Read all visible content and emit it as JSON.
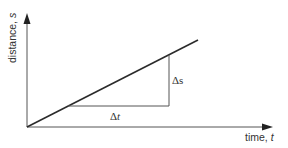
{
  "diagram": {
    "y_axis": {
      "label": "distance, ",
      "symbol": "s"
    },
    "x_axis": {
      "label": "time, ",
      "symbol": "t"
    },
    "delta_t": {
      "prefix": "Δ",
      "symbol": "t"
    },
    "delta_s": {
      "prefix": "Δ",
      "symbol": "s"
    },
    "colors": {
      "axis": "#555555",
      "line": "#2b2b2b",
      "triangle": "#555555",
      "text": "#333333"
    }
  }
}
